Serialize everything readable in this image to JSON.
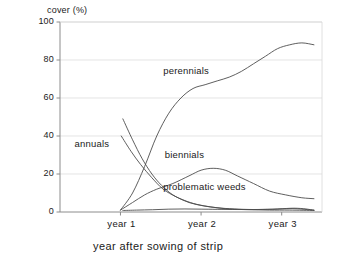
{
  "chart_data": {
    "type": "line",
    "title": "",
    "xlabel": "year after sowing of strip",
    "ylabel": "cover (%)",
    "ylim": [
      0,
      100
    ],
    "xlim": [
      0,
      3.25
    ],
    "yticks": [
      0,
      20,
      40,
      60,
      80,
      100
    ],
    "ytick_labels": [
      "0",
      "20",
      "40",
      "60",
      "80",
      "100"
    ],
    "xticks": [
      0.75,
      1.75,
      2.75
    ],
    "xtick_labels": [
      "year 1",
      "year 2",
      "year 3"
    ],
    "grid": true,
    "legend_position": "inline-annotations",
    "series": [
      {
        "name": "perennials",
        "label": "perennials",
        "color": "#4d4d4d",
        "x": [
          0.75,
          0.9,
          1.05,
          1.2,
          1.35,
          1.5,
          1.65,
          1.8,
          1.95,
          2.1,
          2.25,
          2.4,
          2.55,
          2.7,
          2.85,
          3.0,
          3.15
        ],
        "values": [
          1,
          10,
          24,
          40,
          52,
          60,
          65,
          67,
          69,
          71,
          74,
          78,
          82,
          86,
          88,
          89,
          88
        ]
      },
      {
        "name": "annuals",
        "label": "annuals",
        "color": "#4d4d4d",
        "x": [
          0.78,
          0.9,
          1.02,
          1.14,
          1.26,
          1.4,
          1.55,
          1.7,
          1.9,
          2.1,
          2.35,
          2.6,
          2.85,
          3.15
        ],
        "values": [
          49,
          38,
          28,
          20,
          14,
          9,
          6,
          4,
          2.5,
          1.6,
          1.2,
          1.0,
          1.0,
          0.8
        ]
      },
      {
        "name": "second-declining-curve",
        "label": "",
        "color": "#4d4d4d",
        "x": [
          0.76,
          0.88,
          1.0,
          1.14,
          1.28,
          1.44,
          1.6,
          1.78,
          1.96,
          2.16,
          2.4,
          2.64,
          2.88,
          3.15
        ],
        "values": [
          40,
          32,
          25,
          18,
          12,
          8,
          5,
          3.2,
          2.2,
          1.6,
          1.3,
          1.4,
          1.8,
          1.0
        ]
      },
      {
        "name": "biennials",
        "label": "biennials",
        "color": "#4d4d4d",
        "x": [
          0.75,
          0.9,
          1.05,
          1.2,
          1.4,
          1.6,
          1.75,
          1.9,
          2.05,
          2.2,
          2.4,
          2.6,
          2.8,
          3.0,
          3.15
        ],
        "values": [
          1,
          5,
          9,
          12,
          15,
          19,
          22,
          23,
          22,
          19,
          15,
          11,
          9,
          7.5,
          7
        ]
      },
      {
        "name": "problematic-weeds",
        "label": "problematic weeds",
        "color": "#4d4d4d",
        "x": [
          0.78,
          0.95,
          1.15,
          1.35,
          1.55,
          1.75,
          1.95,
          2.2,
          2.45,
          2.7,
          2.9,
          3.05,
          3.15
        ],
        "values": [
          0.8,
          1.0,
          1.2,
          1.5,
          1.6,
          1.5,
          1.4,
          1.3,
          1.3,
          1.6,
          2.0,
          1.6,
          0.9
        ]
      }
    ],
    "annotations": [
      {
        "text": "perennials",
        "x": 1.28,
        "y": 74
      },
      {
        "text": "annuals",
        "x": 0.18,
        "y": 36
      },
      {
        "text": "biennials",
        "x": 1.3,
        "y": 30
      },
      {
        "text": "problematic weeds",
        "x": 1.28,
        "y": 13
      }
    ]
  },
  "axes": {
    "ylabel": "cover (%)",
    "xlabel": "year after sowing of strip",
    "ytick_labels": [
      "100",
      "80",
      "60",
      "40",
      "20",
      "0"
    ],
    "xtick_labels": [
      "year 1",
      "year 2",
      "year 3"
    ]
  },
  "colors": {
    "line": "#4d4d4d",
    "frame": "#8c8c8c",
    "grid": "#d8d8d8",
    "text": "#1a1a1a",
    "background": "#ffffff"
  }
}
